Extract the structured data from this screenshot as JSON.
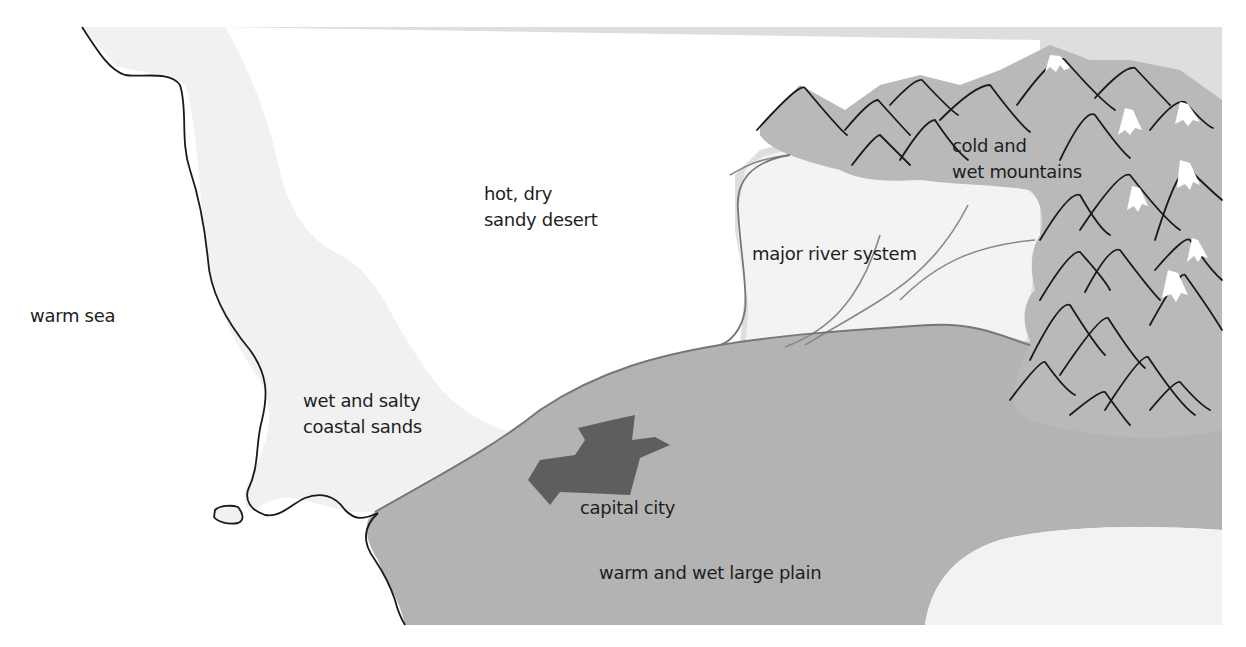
{
  "map": {
    "colors": {
      "sea": "#ffffff",
      "coastal_sands": "#f1f1f1",
      "desert": "#dedede",
      "river_lowland": "#f3f3f3",
      "plain": "#b3b3b3",
      "mountains": "#b9b9b9",
      "snow": "#ffffff",
      "city": "#5e5e5e",
      "outline": "#1a1a1a",
      "boundary": "#777777"
    },
    "regions": [
      {
        "id": "warm-sea",
        "label": "warm sea"
      },
      {
        "id": "hot-dry-sandy-desert",
        "label": "hot, dry\nsandy desert"
      },
      {
        "id": "major-river-system",
        "label": "major river system"
      },
      {
        "id": "cold-wet-mountains",
        "label": "cold and\nwet mountains"
      },
      {
        "id": "wet-salty-coastal-sands",
        "label": "wet and salty\ncoastal sands"
      },
      {
        "id": "capital-city",
        "label": "capital city"
      },
      {
        "id": "warm-wet-large-plain",
        "label": "warm and wet large plain"
      }
    ]
  }
}
